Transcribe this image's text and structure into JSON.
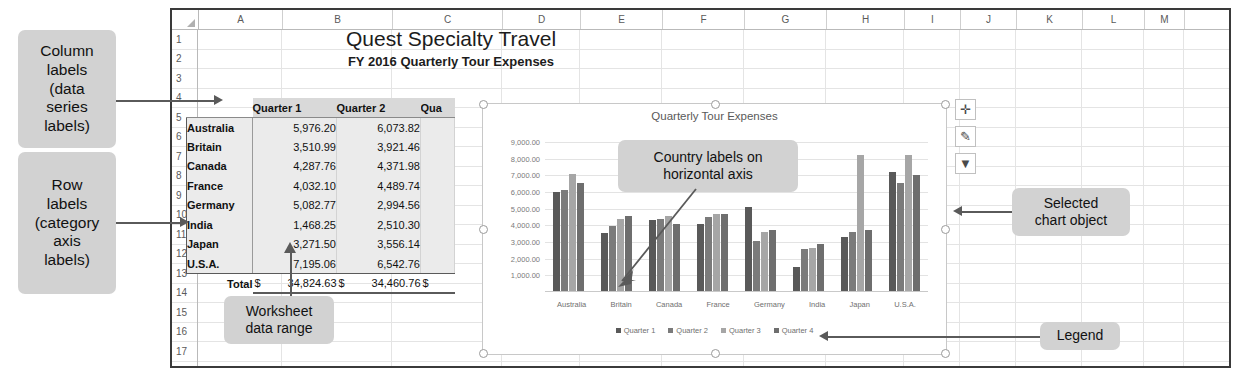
{
  "worksheet": {
    "column_headers": [
      "A",
      "B",
      "C",
      "D",
      "E",
      "F",
      "G",
      "H",
      "I",
      "J",
      "K",
      "L",
      "M"
    ],
    "row_numbers": [
      "1",
      "2",
      "3",
      "4",
      "5",
      "6",
      "7",
      "8",
      "9",
      "10",
      "11",
      "12",
      "13",
      "14",
      "15",
      "16",
      "17",
      "18"
    ],
    "title": "Quest Specialty Travel",
    "subtitle": "FY 2016 Quarterly Tour Expenses",
    "table": {
      "headers": [
        "",
        "Quarter 1",
        "Quarter 2",
        "Qua"
      ],
      "rows": [
        {
          "country": "Australia",
          "q1": "5,976.20",
          "q2": "6,073.82"
        },
        {
          "country": "Britain",
          "q1": "3,510.99",
          "q2": "3,921.46"
        },
        {
          "country": "Canada",
          "q1": "4,287.76",
          "q2": "4,371.98"
        },
        {
          "country": "France",
          "q1": "4,032.10",
          "q2": "4,489.74"
        },
        {
          "country": "Germany",
          "q1": "5,082.77",
          "q2": "2,994.56"
        },
        {
          "country": "India",
          "q1": "1,468.25",
          "q2": "2,510.30"
        },
        {
          "country": "Japan",
          "q1": "3,271.50",
          "q2": "3,556.14"
        },
        {
          "country": "U.S.A.",
          "q1": "7,195.06",
          "q2": "6,542.76"
        }
      ],
      "total_label": "Total",
      "total_q1": "34,824.63",
      "total_q2": "34,460.76",
      "currency_symbol": "$"
    }
  },
  "chart": {
    "buttons": [
      {
        "name": "chart-elements-button",
        "glyph": "✛"
      },
      {
        "name": "chart-styles-button",
        "glyph": "✎"
      },
      {
        "name": "chart-filters-button",
        "glyph": "▼"
      }
    ]
  },
  "chart_data": {
    "type": "bar",
    "title": "Quarterly Tour Expenses",
    "xlabel": "",
    "ylabel": "",
    "ylim": [
      0,
      9000
    ],
    "grid": true,
    "legend_position": "bottom",
    "yticks": [
      "1,000.00",
      "2,000.00",
      "3,000.00",
      "4,000.00",
      "5,000.00",
      "6,000.00",
      "7,000.00",
      "8,000.00",
      "9,000.00"
    ],
    "categories": [
      "Australia",
      "Britain",
      "Canada",
      "France",
      "Germany",
      "India",
      "Japan",
      "U.S.A."
    ],
    "series": [
      {
        "name": "Quarter 1",
        "color": "#595959",
        "values": [
          5976.2,
          3510.99,
          4287.76,
          4032.1,
          5082.77,
          1468.25,
          3271.5,
          7195.06
        ]
      },
      {
        "name": "Quarter 2",
        "color": "#7b7b7b",
        "values": [
          6073.82,
          3921.46,
          4371.98,
          4489.74,
          2994.56,
          2510.3,
          3556.14,
          6542.76
        ]
      },
      {
        "name": "Quarter 3",
        "color": "#a6a6a6",
        "values": [
          7067.0,
          4330.0,
          4548.0,
          4626.0,
          3556.0,
          2614.0,
          8219.0,
          8219.0
        ]
      },
      {
        "name": "Quarter 4",
        "color": "#6e6e6e",
        "values": [
          6503.0,
          4550.0,
          4068.0,
          4644.0,
          3684.0,
          2854.0,
          3684.0,
          6980.0
        ]
      }
    ]
  },
  "callouts": {
    "column_labels": "Column\nlabels\n(data\nseries\nlabels)",
    "column_labels_lines": [
      "Column",
      "labels",
      "(data",
      "series",
      "labels)"
    ],
    "row_labels_lines": [
      "Row",
      "labels",
      "(category",
      "axis",
      "labels)"
    ],
    "worksheet_range_lines": [
      "Worksheet",
      "data range"
    ],
    "country_axis_lines": [
      "Country labels on",
      "horizontal axis"
    ],
    "selected_chart_lines": [
      "Selected",
      "chart object"
    ],
    "legend_lines": [
      "Legend"
    ]
  }
}
